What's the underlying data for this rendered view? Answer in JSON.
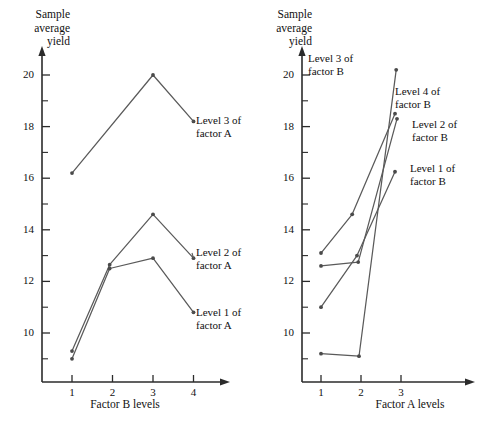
{
  "figure": {
    "background": "#ffffff",
    "line_color": "#5a5a5a",
    "axis_color": "#2b2b2b",
    "text_color": "#111111"
  },
  "chart_data": [
    {
      "type": "line",
      "panel": "left",
      "title": "",
      "xlabel": "Factor B levels",
      "ylabel": "Sample\naverage\nyield",
      "ylabel_lines": [
        "Sample",
        "average",
        "yield"
      ],
      "x": [
        1,
        2,
        3,
        4
      ],
      "categories": [
        "1",
        "2",
        "3",
        "4"
      ],
      "xtick_labels": [
        "1",
        "2",
        "3",
        "4"
      ],
      "ytick_labels": [
        "20",
        "18",
        "16",
        "14",
        "12",
        "10"
      ],
      "ytick_values": [
        20,
        18,
        16,
        14,
        12,
        10
      ],
      "yminor_values": [
        19,
        17,
        15,
        13,
        11,
        9
      ],
      "xlim": [
        0.55,
        4.75
      ],
      "ylim": [
        8.6,
        20.6
      ],
      "grid": false,
      "legend": "inline-annotations",
      "series": [
        {
          "name": "Level 3 of factor A",
          "label_lines": [
            "Level 3 of",
            "factor A"
          ],
          "values": [
            16.2,
            null,
            20.0,
            18.2
          ],
          "points": [
            {
              "x": 1,
              "y": 16.2
            },
            {
              "x": 3,
              "y": 20.0
            },
            {
              "x": 4,
              "y": 18.2
            }
          ]
        },
        {
          "name": "Level 2 of factor A",
          "label_lines": [
            "Level 2 of",
            "factor A"
          ],
          "values": [
            9.3,
            12.65,
            14.6,
            12.9
          ],
          "points": [
            {
              "x": 1,
              "y": 9.3
            },
            {
              "x": 1.93,
              "y": 12.65
            },
            {
              "x": 3,
              "y": 14.6
            },
            {
              "x": 4,
              "y": 12.9
            }
          ]
        },
        {
          "name": "Level 1 of factor A",
          "label_lines": [
            "Level 1 of",
            "factor A"
          ],
          "values": [
            9.0,
            12.5,
            12.9,
            10.8
          ],
          "points": [
            {
              "x": 1,
              "y": 9.0
            },
            {
              "x": 1.93,
              "y": 12.5
            },
            {
              "x": 3,
              "y": 12.9
            },
            {
              "x": 4,
              "y": 10.8
            }
          ]
        }
      ]
    },
    {
      "type": "line",
      "panel": "right",
      "title": "",
      "xlabel": "Factor A levels",
      "ylabel": "Sample\naverage\nyield",
      "ylabel_lines": [
        "Sample",
        "average",
        "yield"
      ],
      "x": [
        1,
        2,
        3
      ],
      "categories": [
        "1",
        "2",
        "3"
      ],
      "xtick_labels": [
        "1",
        "2",
        "3"
      ],
      "ytick_labels": [
        "20",
        "18",
        "16",
        "14",
        "12",
        "10"
      ],
      "ytick_values": [
        20,
        18,
        16,
        14,
        12,
        10
      ],
      "yminor_values": [
        19,
        17,
        15,
        13,
        11,
        9
      ],
      "xlim": [
        0.55,
        3.95
      ],
      "ylim": [
        8.6,
        20.6
      ],
      "grid": false,
      "legend": "inline-annotations",
      "series": [
        {
          "name": "Level 3 of factor B",
          "label_lines": [
            "Level 3 of",
            "factor B"
          ],
          "values": [
            9.2,
            9.1,
            20.2
          ],
          "points": [
            {
              "x": 1,
              "y": 9.2
            },
            {
              "x": 1.95,
              "y": 9.1
            },
            {
              "x": 2.88,
              "y": 20.2
            }
          ]
        },
        {
          "name": "Level 4 of factor B",
          "label_lines": [
            "Level 4 of",
            "factor B"
          ],
          "values": [
            13.1,
            14.6,
            18.5
          ],
          "points": [
            {
              "x": 1,
              "y": 13.1
            },
            {
              "x": 1.78,
              "y": 14.6
            },
            {
              "x": 2.85,
              "y": 18.5
            }
          ]
        },
        {
          "name": "Level 2 of factor B",
          "label_lines": [
            "Level 2 of",
            "factor B"
          ],
          "values": [
            12.6,
            12.75,
            18.3
          ],
          "points": [
            {
              "x": 1,
              "y": 12.6
            },
            {
              "x": 1.93,
              "y": 12.75
            },
            {
              "x": 2.9,
              "y": 18.3
            }
          ]
        },
        {
          "name": "Level 1 of factor B",
          "label_lines": [
            "Level 1 of",
            "factor B"
          ],
          "values": [
            11.0,
            13.0,
            16.25
          ],
          "points": [
            {
              "x": 1,
              "y": 11.0
            },
            {
              "x": 1.9,
              "y": 13.0
            },
            {
              "x": 2.85,
              "y": 16.25
            }
          ]
        }
      ]
    }
  ],
  "left": {
    "ytitle": "Sample\naverage\nyield",
    "xtitle": "Factor B levels",
    "yticks": [
      "20",
      "18",
      "16",
      "14",
      "12",
      "10"
    ],
    "xticks": [
      "1",
      "2",
      "3",
      "4"
    ],
    "annotations": {
      "level3": "Level 3 of\nfactor A",
      "level2": "Level 2 of\nfactor A",
      "level1": "Level 1 of\nfactor A"
    }
  },
  "right": {
    "ytitle": "Sample\naverage\nyield",
    "xtitle": "Factor A levels",
    "yticks": [
      "20",
      "18",
      "16",
      "14",
      "12",
      "10"
    ],
    "xticks": [
      "1",
      "2",
      "3"
    ],
    "annotations": {
      "level3": "Level 3 of\nfactor B",
      "level4": "Level 4 of\nfactor B",
      "level2": "Level 2 of\nfactor B",
      "level1": "Level 1 of\nfactor B"
    }
  }
}
